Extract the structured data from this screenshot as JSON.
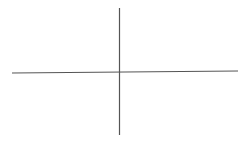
{
  "diagram": {
    "type": "axes-cross",
    "background": "#ffffff",
    "line_color": "#555555",
    "line_width": 1.2,
    "vertical_axis": {
      "x1": 119.5,
      "y1": 8,
      "x2": 119.5,
      "y2": 135
    },
    "horizontal_axis": {
      "x1": 12,
      "y1": 73,
      "x2": 238,
      "y2": 71
    }
  }
}
